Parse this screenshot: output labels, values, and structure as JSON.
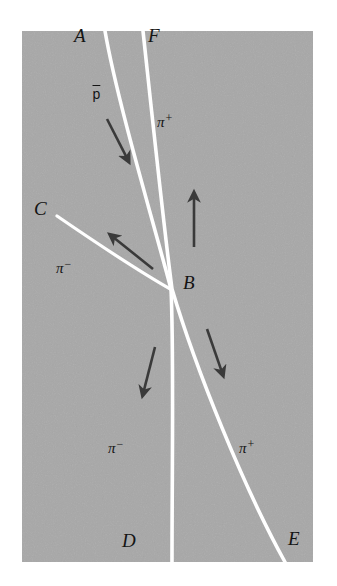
{
  "figure": {
    "kind": "bubble-chamber-event-diagram",
    "background_color": "#ffffff",
    "chamber": {
      "fill_color": "#a8a8a8",
      "x": 22,
      "y": 31,
      "width": 291,
      "height": 531
    },
    "track_color": "#ffffff",
    "arrow_color": "#3a3a3a",
    "text_color": "#141414"
  },
  "vertex_labels": [
    {
      "id": "A",
      "text": "A",
      "x": 74,
      "y": 26,
      "name": "vertex-label-a"
    },
    {
      "id": "F",
      "text": "F",
      "x": 148,
      "y": 26,
      "name": "vertex-label-f"
    },
    {
      "id": "C",
      "text": "C",
      "x": 34,
      "y": 199,
      "name": "vertex-label-c"
    },
    {
      "id": "B",
      "text": "B",
      "x": 183,
      "y": 273,
      "name": "vertex-label-b"
    },
    {
      "id": "D",
      "text": "D",
      "x": 122,
      "y": 531,
      "name": "vertex-label-d"
    },
    {
      "id": "E",
      "text": "E",
      "x": 288,
      "y": 529,
      "name": "vertex-label-e"
    }
  ],
  "particle_labels": [
    {
      "id": "pbar",
      "symbol": "p",
      "charge": "",
      "overbar": true,
      "x": 92,
      "y": 87,
      "name": "particle-label-antiproton"
    },
    {
      "id": "piplus_up",
      "symbol": "π",
      "charge": "+",
      "overbar": false,
      "x": 157,
      "y": 112,
      "name": "particle-label-pi-plus-upper"
    },
    {
      "id": "piminus_c",
      "symbol": "π",
      "charge": "−",
      "overbar": false,
      "x": 56,
      "y": 258,
      "name": "particle-label-pi-minus-c"
    },
    {
      "id": "piminus_d",
      "symbol": "π",
      "charge": "−",
      "overbar": false,
      "x": 108,
      "y": 438,
      "name": "particle-label-pi-minus-d"
    },
    {
      "id": "piplus_e",
      "symbol": "π",
      "charge": "+",
      "overbar": false,
      "x": 239,
      "y": 438,
      "name": "particle-label-pi-plus-e"
    }
  ],
  "tracks": [
    {
      "id": "A-B-D",
      "name": "track-a-b-d",
      "from": "A",
      "to": "D",
      "through": "B",
      "particle_in": "p̄",
      "particle_out": "π−",
      "path": "M 105 31 C 117 100, 150 210, 171 289 C 174 350, 172 470, 172 562"
    },
    {
      "id": "F-B-E",
      "name": "track-f-b-e",
      "from": "F",
      "to": "E",
      "through": "B",
      "particle_in": "π+",
      "particle_out": "π+",
      "path": "M 143 31 C 151 105, 163 220, 172 289 C 196 370, 245 490, 285 562"
    },
    {
      "id": "C-B",
      "name": "track-c-b",
      "from": "C",
      "to": "B",
      "particle_in": "π−",
      "path": "M 57 216 C 92 240, 140 272, 172 290"
    }
  ],
  "arrows": [
    {
      "id": "arrow-pbar",
      "name": "arrow-antiproton",
      "x1": 107,
      "y1": 119,
      "x2": 130,
      "y2": 164
    },
    {
      "id": "arrow-piplus-up",
      "name": "arrow-pi-plus-upward",
      "x1": 194,
      "y1": 247,
      "x2": 194,
      "y2": 190
    },
    {
      "id": "arrow-piminus-c",
      "name": "arrow-pi-minus-upleft",
      "x1": 153,
      "y1": 269,
      "x2": 108,
      "y2": 233
    },
    {
      "id": "arrow-piminus-d",
      "name": "arrow-pi-minus-down",
      "x1": 155,
      "y1": 347,
      "x2": 142,
      "y2": 398
    },
    {
      "id": "arrow-piplus-e",
      "name": "arrow-pi-plus-downright",
      "x1": 207,
      "y1": 329,
      "x2": 224,
      "y2": 378
    }
  ]
}
